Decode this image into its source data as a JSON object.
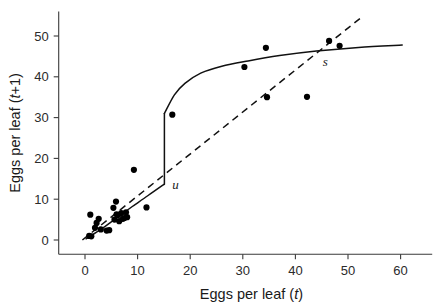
{
  "figure": {
    "background": "#ffffff",
    "ink_color": "#111111"
  },
  "chart_data": {
    "type": "scatter",
    "title": "",
    "subtitle": "",
    "xlabel_prefix": "Eggs per leaf (",
    "xlabel_italic": "t",
    "xlabel_suffix": ")",
    "ylabel_prefix": "Eggs per leaf (",
    "ylabel_italic": "t",
    "ylabel_suffix": "+1)",
    "xlim": [
      -5,
      66
    ],
    "ylim": [
      -3.5,
      56
    ],
    "xticks": [
      0,
      10,
      20,
      30,
      40,
      50,
      60
    ],
    "yticks": [
      0,
      10,
      20,
      30,
      40,
      50
    ],
    "xtick_labels": [
      "0",
      "10",
      "20",
      "30",
      "40",
      "50",
      "60"
    ],
    "ytick_labels": [
      "0",
      "10",
      "20",
      "30",
      "40",
      "50"
    ],
    "grid": false,
    "legend": "none",
    "marker": "filled-circle",
    "marker_color": "#000000",
    "marker_radius_px": 3.1,
    "points": [
      {
        "x": 0.8,
        "y": 1.0
      },
      {
        "x": 1.0,
        "y": 6.2
      },
      {
        "x": 1.2,
        "y": 0.9
      },
      {
        "x": 1.9,
        "y": 3.0
      },
      {
        "x": 2.2,
        "y": 4.2
      },
      {
        "x": 2.6,
        "y": 5.2
      },
      {
        "x": 3.0,
        "y": 2.6
      },
      {
        "x": 4.1,
        "y": 2.3
      },
      {
        "x": 4.6,
        "y": 2.4
      },
      {
        "x": 5.4,
        "y": 7.9
      },
      {
        "x": 5.6,
        "y": 5.0
      },
      {
        "x": 5.9,
        "y": 9.4
      },
      {
        "x": 6.0,
        "y": 6.3
      },
      {
        "x": 6.3,
        "y": 6.1
      },
      {
        "x": 6.5,
        "y": 4.6
      },
      {
        "x": 6.9,
        "y": 6.6
      },
      {
        "x": 7.2,
        "y": 5.2
      },
      {
        "x": 7.5,
        "y": 5.4
      },
      {
        "x": 7.8,
        "y": 6.8
      },
      {
        "x": 8.0,
        "y": 5.6
      },
      {
        "x": 9.3,
        "y": 17.2
      },
      {
        "x": 11.7,
        "y": 8.0
      },
      {
        "x": 16.6,
        "y": 30.7
      },
      {
        "x": 30.3,
        "y": 42.4
      },
      {
        "x": 34.4,
        "y": 47.1
      },
      {
        "x": 34.6,
        "y": 35.0
      },
      {
        "x": 42.2,
        "y": 35.1
      },
      {
        "x": 46.4,
        "y": 48.8
      },
      {
        "x": 48.4,
        "y": 47.6
      }
    ],
    "model_curve": {
      "name": "fitted discontinuous recruitment curve",
      "style": "solid",
      "breakpoint_x": 15.1,
      "lower_branch": [
        {
          "x": 0.2,
          "y": 0.3
        },
        {
          "x": 3.0,
          "y": 2.6
        },
        {
          "x": 6.0,
          "y": 5.4
        },
        {
          "x": 9.0,
          "y": 8.2
        },
        {
          "x": 12.0,
          "y": 10.9
        },
        {
          "x": 15.1,
          "y": 13.7
        }
      ],
      "jump": [
        {
          "x": 15.1,
          "y": 13.7
        },
        {
          "x": 15.1,
          "y": 31.0
        }
      ],
      "upper_branch": [
        {
          "x": 15.1,
          "y": 31.0
        },
        {
          "x": 17.0,
          "y": 35.6
        },
        {
          "x": 19.0,
          "y": 38.4
        },
        {
          "x": 22.0,
          "y": 40.9
        },
        {
          "x": 26.0,
          "y": 42.6
        },
        {
          "x": 31.0,
          "y": 43.9
        },
        {
          "x": 37.0,
          "y": 45.2
        },
        {
          "x": 44.0,
          "y": 46.3
        },
        {
          "x": 52.0,
          "y": 47.2
        },
        {
          "x": 60.3,
          "y": 47.8
        }
      ]
    },
    "replacement_line": {
      "name": "one-to-one replacement line",
      "style": "dashed",
      "from": {
        "x": -0.5,
        "y": 0.0
      },
      "to": {
        "x": 52.5,
        "y": 54.5
      }
    },
    "annotations": [
      {
        "label": "u",
        "meaning": "unstable-equilibrium",
        "x": 16.6,
        "y": 12.4
      },
      {
        "label": "s",
        "meaning": "stable-equilibrium",
        "x": 45.2,
        "y": 42.6
      }
    ]
  },
  "caption": {
    "cut_off_text": ""
  }
}
